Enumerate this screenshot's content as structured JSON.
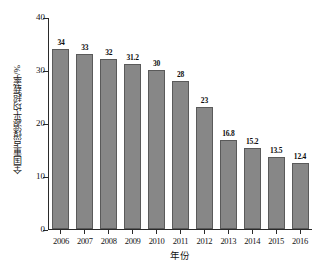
{
  "chart_data": {
    "type": "bar",
    "title": "",
    "xlabel": "年份",
    "ylabel": "全国重点煤源平均超载率/%",
    "categories": [
      "2006",
      "2007",
      "2008",
      "2009",
      "2010",
      "2011",
      "2012",
      "2013",
      "2014",
      "2015",
      "2016"
    ],
    "values": [
      34,
      33,
      32,
      31.2,
      30,
      28,
      23,
      16.8,
      15.2,
      13.5,
      12.4
    ],
    "value_labels": [
      "34",
      "33",
      "32",
      "31.2",
      "30",
      "28",
      "23",
      "16.8",
      "15.2",
      "13.5",
      "12.4"
    ],
    "ylim": [
      0,
      40
    ],
    "y_ticks": [
      0,
      10,
      20,
      30,
      40
    ],
    "y_tick_labels": [
      "0",
      "10",
      "20",
      "30",
      "40"
    ],
    "grid": false,
    "legend": null,
    "series": [
      {
        "name": "全国重点煤源平均超载率",
        "values": [
          34,
          33,
          32,
          31.2,
          30,
          28,
          23,
          16.8,
          15.2,
          13.5,
          12.4
        ]
      }
    ],
    "colors": {
      "bar_fill": "#878787",
      "bar_border": "#5a5a5a",
      "axis": "#2a2a2a",
      "text": "#141414",
      "background": "#ffffff"
    }
  }
}
